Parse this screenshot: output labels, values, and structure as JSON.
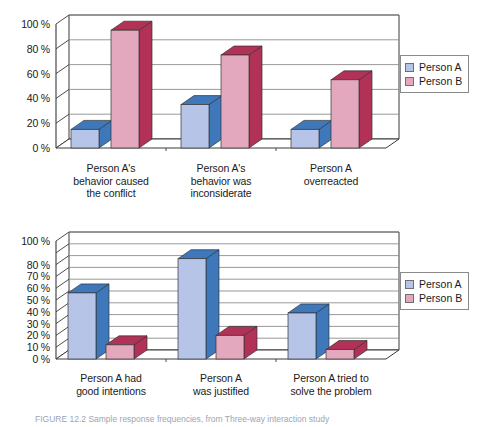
{
  "figure": {
    "caption": "FIGURE 12.2  Sample response frequencies, from Three-way interaction study",
    "legend_labels": [
      "Person A",
      "Person B"
    ],
    "colors": {
      "person_a_front": "#b6c4e8",
      "person_a_top": "#3e78bb",
      "person_a_side": "#3e78bb",
      "person_b_front": "#e3a8bd",
      "person_b_top": "#b23157",
      "person_b_side": "#b23157",
      "grid": "#8d8d8d",
      "axis": "#3a3a3a",
      "text": "#1a1a1a"
    }
  },
  "chart_data": [
    {
      "id": "top",
      "type": "bar",
      "title": "",
      "xlabel": "",
      "ylabel": "",
      "ylim": [
        0,
        100
      ],
      "ytick_values": [
        0,
        20,
        40,
        60,
        80,
        100
      ],
      "ytick_labels": [
        "0 %",
        "20 %",
        "40 %",
        "60 %",
        "80 %",
        "100 %"
      ],
      "gridline_values": [
        0,
        20,
        40,
        60,
        80,
        100
      ],
      "grid": true,
      "legend_position": "right",
      "categories": [
        "Person A's\nbehavior caused\nthe conflict",
        "Person A's\nbehavior was\ninconsiderate",
        "Person A\noverreacted"
      ],
      "series": [
        {
          "name": "Person A",
          "values": [
            15,
            35,
            15
          ]
        },
        {
          "name": "Person B",
          "values": [
            95,
            75,
            55
          ]
        }
      ]
    },
    {
      "id": "bottom",
      "type": "bar",
      "title": "",
      "xlabel": "",
      "ylabel": "",
      "ylim": [
        0,
        100
      ],
      "ytick_values": [
        0,
        10,
        20,
        30,
        40,
        50,
        60,
        70,
        80,
        100
      ],
      "ytick_labels": [
        "0 %",
        "10 %",
        "20 %",
        "30 %",
        "40 %",
        "50 %",
        "60 %",
        "70 %",
        "80 %",
        "100 %"
      ],
      "gridline_values": [
        0,
        10,
        20,
        30,
        40,
        50,
        60,
        70,
        80,
        90,
        100
      ],
      "grid": true,
      "legend_position": "right",
      "categories": [
        "Person A had\ngood intentions",
        "Person A\nwas justified",
        "Person A tried to\nsolve the problem"
      ],
      "series": [
        {
          "name": "Person A",
          "values": [
            56,
            85,
            39
          ]
        },
        {
          "name": "Person B",
          "values": [
            12,
            20,
            8
          ]
        }
      ]
    }
  ]
}
